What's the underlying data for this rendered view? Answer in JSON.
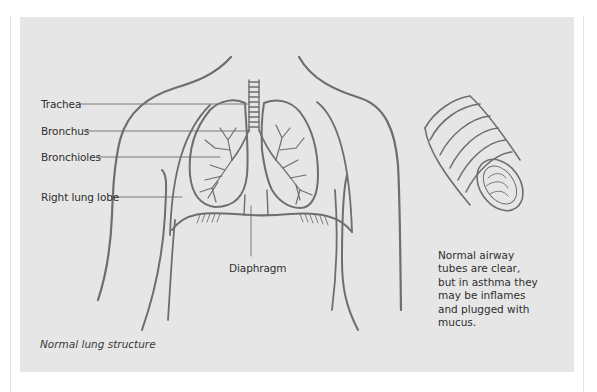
{
  "figure": {
    "caption": "Normal lung structure",
    "panel_color": "#e6e6e6",
    "line_color": "#6e6e6e",
    "labels": {
      "trachea": "Trachea",
      "bronchus": "Bronchus",
      "bronchioles": "Bronchioles",
      "right_lung_lobe": "Right lung lobe",
      "diaphragm": "Diaphragm"
    },
    "airway_note": "Normal airway tubes are clear, but in asthma they may be inflames and plugged with mucus."
  }
}
